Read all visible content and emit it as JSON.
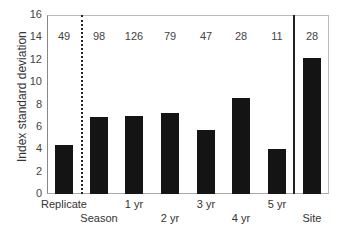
{
  "chart_data": {
    "type": "bar",
    "title": "",
    "xlabel": "",
    "ylabel": "Index standard deviation",
    "ylim": [
      0,
      16
    ],
    "yticks": [
      0,
      2,
      4,
      6,
      8,
      10,
      12,
      14,
      16
    ],
    "categories": [
      "Replicate",
      "Season",
      "1 yr",
      "2 yr",
      "3 yr",
      "4 yr",
      "5 yr",
      "Site"
    ],
    "values": [
      4.4,
      6.9,
      7.0,
      7.2,
      5.7,
      8.6,
      4.0,
      12.2
    ],
    "sample_sizes": [
      "49",
      "98",
      "126",
      "79",
      "47",
      "28",
      "11",
      "28"
    ],
    "separators": [
      {
        "after": "Replicate",
        "style": "dotted"
      },
      {
        "after": "5 yr",
        "style": "solid"
      }
    ],
    "grid": false,
    "legend": null
  },
  "labels": {
    "ylabel": "Index standard deviation",
    "yticks": [
      "0",
      "2",
      "4",
      "6",
      "8",
      "10",
      "12",
      "14",
      "16"
    ]
  }
}
